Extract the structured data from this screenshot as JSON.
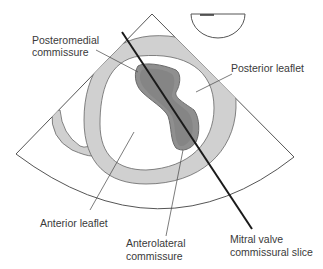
{
  "diagram": {
    "type": "echocardiography-schematic",
    "colors": {
      "background": "#ffffff",
      "outline": "#555555",
      "annulus_fill": "#d0d0d0",
      "commissure_fill": "#8f8f8f",
      "commissure_outline": "#6a6a6a",
      "slice_line": "#1a1a1a",
      "leader_line": "#444444",
      "text": "#3a3a3a"
    },
    "labels": {
      "posteromedial_line1": "Posteromedial",
      "posteromedial_line2": "commissure",
      "posterior_leaflet": "Posterior leaflet",
      "anterior_leaflet": "Anterior leaflet",
      "anterolateral_line1": "Anterolateral",
      "anterolateral_line2": "commissure",
      "slice_line1": "Mitral valve",
      "slice_line2": "commissural slice"
    },
    "icons": {
      "orientation_marker": "semicircle-probe-icon"
    }
  }
}
